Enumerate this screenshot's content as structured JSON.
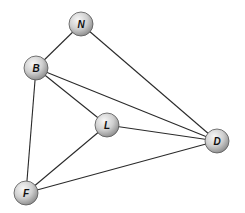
{
  "diagram": {
    "type": "undirected-graph",
    "node_radius": 12,
    "colors": {
      "edge": "#2a2a2a",
      "node_fill_light": "#f2f2f2",
      "node_fill_dark": "#9a9a9a",
      "node_stroke": "#555555",
      "label": "#111111"
    },
    "nodes": [
      {
        "id": "N",
        "label": "N",
        "x": 81,
        "y": 24
      },
      {
        "id": "B",
        "label": "B",
        "x": 36,
        "y": 68
      },
      {
        "id": "L",
        "label": "L",
        "x": 107,
        "y": 125
      },
      {
        "id": "D",
        "label": "D",
        "x": 217,
        "y": 141
      },
      {
        "id": "F",
        "label": "F",
        "x": 26,
        "y": 193
      }
    ],
    "edges": [
      {
        "from": "N",
        "to": "B"
      },
      {
        "from": "N",
        "to": "D"
      },
      {
        "from": "B",
        "to": "L"
      },
      {
        "from": "B",
        "to": "D"
      },
      {
        "from": "B",
        "to": "F"
      },
      {
        "from": "L",
        "to": "D"
      },
      {
        "from": "L",
        "to": "F"
      },
      {
        "from": "F",
        "to": "D"
      }
    ]
  }
}
